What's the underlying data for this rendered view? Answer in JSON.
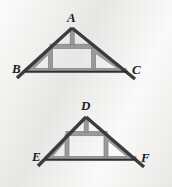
{
  "figure": {
    "background_color": "#edecea",
    "rafter_color": "#3c3c3c",
    "brace_color": "#9a9a9a",
    "brace_edge_color": "#7d7d7d",
    "chord_color": "#9a9a9a",
    "label_color": "#1c1c1c"
  },
  "trusses": [
    {
      "id": "upper-truss",
      "name": "triangle-ABC",
      "apex_label": "A",
      "left_label": "B",
      "right_label": "C",
      "apex": {
        "x": 72,
        "y": 28
      },
      "left": {
        "x": 24,
        "y": 72
      },
      "right": {
        "x": 128,
        "y": 72
      },
      "rafter_overhang": 7,
      "collar_tie_y": 46,
      "king_post": {
        "top_y": 30,
        "bottom_y": 46
      },
      "corner_braces": "two diagonal braces and two short vertical posts near base corners"
    },
    {
      "id": "lower-truss",
      "name": "triangle-DEF",
      "apex_label": "D",
      "left_label": "E",
      "right_label": "F",
      "apex": {
        "x": 86,
        "y": 117
      },
      "left": {
        "x": 44,
        "y": 160
      },
      "right": {
        "x": 137,
        "y": 160
      },
      "rafter_overhang": 7,
      "collar_tie_y": 133,
      "king_post": {
        "top_y": 119,
        "bottom_y": 133
      },
      "corner_braces": "two diagonal braces and two short vertical posts near base corners"
    }
  ],
  "labels": [
    {
      "text": "A",
      "x": 67,
      "y": 11,
      "name": "vertex-label-a"
    },
    {
      "text": "B",
      "x": 12,
      "y": 62,
      "name": "vertex-label-b"
    },
    {
      "text": "C",
      "x": 132,
      "y": 63,
      "name": "vertex-label-c"
    },
    {
      "text": "D",
      "x": 81,
      "y": 99,
      "name": "vertex-label-d"
    },
    {
      "text": "E",
      "x": 32,
      "y": 150,
      "name": "vertex-label-e"
    },
    {
      "text": "F",
      "x": 141,
      "y": 151,
      "name": "vertex-label-f"
    }
  ]
}
